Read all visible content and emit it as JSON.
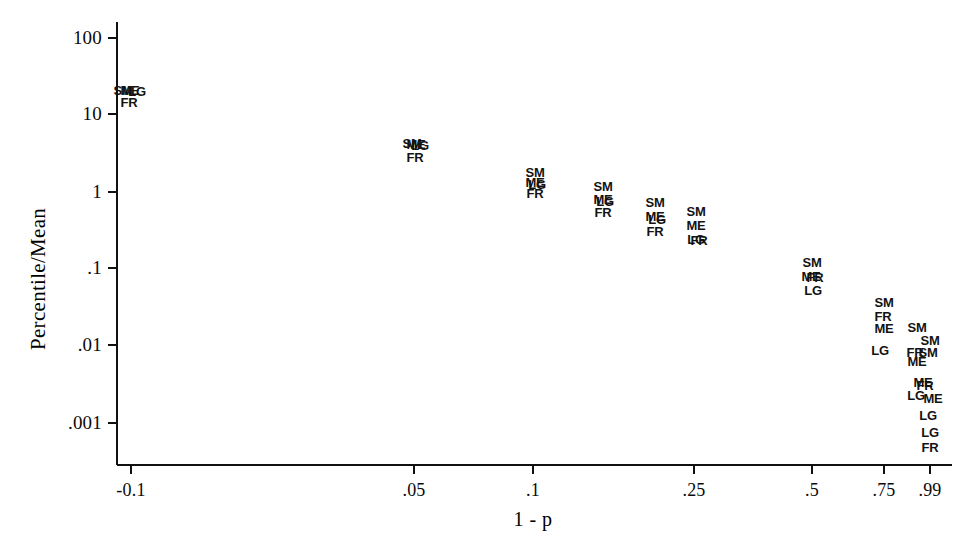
{
  "chart_data": {
    "type": "scatter",
    "title": "",
    "xlabel": "1 - p",
    "ylabel": "Percentile/Mean",
    "x_scale": "custom-normal-quantile",
    "y_scale": "log10",
    "ylim": [
      0.0007,
      180
    ],
    "grid": false,
    "legend": "none",
    "series_key": {
      "SM": "Small firms",
      "ME": "Medium firms",
      "LG": "Large firms",
      "FR": "France / all firms"
    },
    "xticks": [
      {
        "label": "-0.1",
        "px": 131
      },
      {
        "label": ".05",
        "px": 414
      },
      {
        "label": ".1",
        "px": 533
      },
      {
        "label": ".25",
        "px": 694
      },
      {
        "label": ".5",
        "px": 812
      },
      {
        "label": ".75",
        "px": 884
      },
      {
        "label": ".99",
        "px": 930
      }
    ],
    "yticks": [
      {
        "label": "100",
        "px": 38
      },
      {
        "label": "10",
        "px": 114
      },
      {
        "label": "1",
        "px": 192
      },
      {
        "label": ".1",
        "px": 268
      },
      {
        "label": ".01",
        "px": 345
      },
      {
        "label": ".001",
        "px": 423
      }
    ],
    "points": [
      {
        "label": "SM",
        "x_px": 123,
        "y_px": 90,
        "x": "-0.1",
        "y": 22
      },
      {
        "label": "ME",
        "x_px": 130,
        "y_px": 90,
        "x": "-0.1",
        "y": 22
      },
      {
        "label": "LG",
        "x_px": 137,
        "y_px": 91,
        "x": "-0.1",
        "y": 21
      },
      {
        "label": "FR",
        "x_px": 129,
        "y_px": 102,
        "x": "-0.1",
        "y": 16
      },
      {
        "label": "SM",
        "x_px": 412,
        "y_px": 143,
        "x": ".05",
        "y": 3.9
      },
      {
        "label": "ME",
        "x_px": 416,
        "y_px": 144,
        "x": ".05",
        "y": 3.8
      },
      {
        "label": "LG",
        "x_px": 420,
        "y_px": 145,
        "x": ".05",
        "y": 3.7
      },
      {
        "label": "FR",
        "x_px": 415,
        "y_px": 157,
        "x": ".05",
        "y": 2.9
      },
      {
        "label": "SM",
        "x_px": 535,
        "y_px": 172,
        "x": ".1",
        "y": 1.6
      },
      {
        "label": "ME",
        "x_px": 535,
        "y_px": 182,
        "x": ".1",
        "y": 1.25
      },
      {
        "label": "LG",
        "x_px": 537,
        "y_px": 184,
        "x": ".1",
        "y": 1.2
      },
      {
        "label": "FR",
        "x_px": 535,
        "y_px": 193,
        "x": ".1",
        "y": 0.97
      },
      {
        "label": "SM",
        "x_px": 603,
        "y_px": 186,
        "x": ".15",
        "y": 1.15
      },
      {
        "label": "ME",
        "x_px": 603,
        "y_px": 199,
        "x": ".15",
        "y": 0.85
      },
      {
        "label": "LG",
        "x_px": 605,
        "y_px": 201,
        "x": ".15",
        "y": 0.82
      },
      {
        "label": "FR",
        "x_px": 603,
        "y_px": 212,
        "x": ".15",
        "y": 0.62
      },
      {
        "label": "SM",
        "x_px": 655,
        "y_px": 202,
        "x": ".2",
        "y": 0.8
      },
      {
        "label": "ME",
        "x_px": 655,
        "y_px": 216,
        "x": ".2",
        "y": 0.58
      },
      {
        "label": "LG",
        "x_px": 657,
        "y_px": 219,
        "x": ".2",
        "y": 0.55
      },
      {
        "label": "FR",
        "x_px": 655,
        "y_px": 231,
        "x": ".2",
        "y": 0.42
      },
      {
        "label": "SM",
        "x_px": 696,
        "y_px": 211,
        "x": ".25",
        "y": 0.7
      },
      {
        "label": "ME",
        "x_px": 696,
        "y_px": 225,
        "x": ".25",
        "y": 0.51
      },
      {
        "label": "LG",
        "x_px": 696,
        "y_px": 239,
        "x": ".25",
        "y": 0.38
      },
      {
        "label": "FR",
        "x_px": 699,
        "y_px": 240,
        "x": ".25",
        "y": 0.37
      },
      {
        "label": "SM",
        "x_px": 812,
        "y_px": 262,
        "x": ".5",
        "y": 0.12
      },
      {
        "label": "ME",
        "x_px": 811,
        "y_px": 276,
        "x": ".5",
        "y": 0.088
      },
      {
        "label": "FR",
        "x_px": 815,
        "y_px": 277,
        "x": ".5",
        "y": 0.086
      },
      {
        "label": "LG",
        "x_px": 813,
        "y_px": 290,
        "x": ".5",
        "y": 0.065
      },
      {
        "label": "SM",
        "x_px": 884,
        "y_px": 302,
        "x": ".75",
        "y": 0.039
      },
      {
        "label": "FR",
        "x_px": 883,
        "y_px": 316,
        "x": ".75",
        "y": 0.028
      },
      {
        "label": "ME",
        "x_px": 884,
        "y_px": 328,
        "x": ".75",
        "y": 0.021
      },
      {
        "label": "LG",
        "x_px": 880,
        "y_px": 350,
        "x": ".75",
        "y": 0.013
      },
      {
        "label": "SM",
        "x_px": 917,
        "y_px": 327,
        "x": ".9",
        "y": 0.021
      },
      {
        "label": "SM",
        "x_px": 930,
        "y_px": 340,
        "x": ".99",
        "y": 0.015
      },
      {
        "label": "FR",
        "x_px": 915,
        "y_px": 352,
        "x": ".9",
        "y": 0.0105
      },
      {
        "label": "SM",
        "x_px": 928,
        "y_px": 352,
        "x": ".99",
        "y": 0.0105
      },
      {
        "label": "ME",
        "x_px": 917,
        "y_px": 361,
        "x": ".9",
        "y": 0.0088
      },
      {
        "label": "ME",
        "x_px": 923,
        "y_px": 382,
        "x": ".99",
        "y": 0.0058
      },
      {
        "label": "FR",
        "x_px": 925,
        "y_px": 385,
        "x": ".99",
        "y": 0.0055
      },
      {
        "label": "LG",
        "x_px": 916,
        "y_px": 395,
        "x": ".9",
        "y": 0.0045
      },
      {
        "label": "ME",
        "x_px": 933,
        "y_px": 398,
        "x": ".99",
        "y": 0.0042
      },
      {
        "label": "LG",
        "x_px": 928,
        "y_px": 415,
        "x": ".99",
        "y": 0.0028
      },
      {
        "label": "LG",
        "x_px": 930,
        "y_px": 432,
        "x": ".99",
        "y": 0.0017
      },
      {
        "label": "FR",
        "x_px": 930,
        "y_px": 447,
        "x": ".99",
        "y": 0.0011
      }
    ]
  },
  "geometry": {
    "y_axis_x": 117,
    "x_axis_y": 465,
    "axis_top_y": 22,
    "axis_right_x": 952,
    "tick_len": 9
  }
}
